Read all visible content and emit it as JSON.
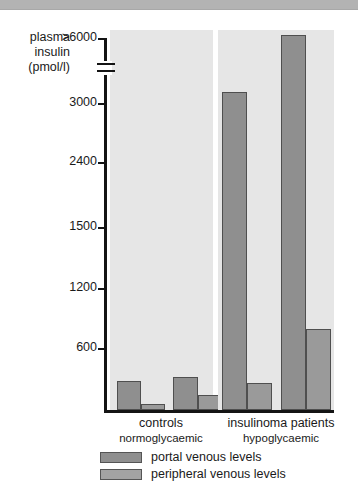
{
  "figure": {
    "axis_title_lines": [
      "plasma",
      "insulin",
      "(pmol/l)"
    ],
    "axis_title_text": "plasma insulin (pmol/l)"
  },
  "chart_data": {
    "type": "bar",
    "title": "",
    "xlabel": "",
    "ylabel": "plasma insulin (pmol/l)",
    "yticks": [
      600,
      1200,
      1500,
      2400,
      3000,
      ">6000"
    ],
    "ytick_labels": [
      "600",
      "1200",
      "1500",
      "2400",
      "3000",
      ">6000"
    ],
    "axis_broken": true,
    "axis_break_between": [
      "3000",
      ">6000"
    ],
    "grid": false,
    "legend_position": "bottom",
    "groups": [
      {
        "label": "controls",
        "sublabel": "normoglycaemic",
        "subjects": [
          {
            "portal": 600,
            "peripheral": 170
          },
          {
            "portal": 640,
            "peripheral": 380
          }
        ]
      },
      {
        "label": "insulinoma patients",
        "sublabel": "hypoglycaemic",
        "subjects": [
          {
            "portal": 3200,
            "peripheral": 560
          },
          {
            "portal": 6000,
            "peripheral": 1000
          }
        ]
      }
    ],
    "series": [
      {
        "name": "portal venous levels",
        "color": "#8f8f8f",
        "values": [
          600,
          640,
          3200,
          6000
        ]
      },
      {
        "name": "peripheral venous levels",
        "color": "#a3a3a3",
        "values": [
          170,
          380,
          560,
          1000
        ]
      }
    ],
    "categories": [
      "controls subject 1",
      "controls subject 2",
      "insulinoma subject 1",
      "insulinoma subject 2"
    ],
    "bars": [
      {
        "group": "controls",
        "series": "portal venous levels",
        "value": 600,
        "left": 7,
        "width": 24,
        "top": 351,
        "panel": "left"
      },
      {
        "group": "controls",
        "series": "peripheral venous levels",
        "value": 170,
        "left": 31,
        "width": 24,
        "top": 374,
        "panel": "left"
      },
      {
        "group": "controls",
        "series": "portal venous levels",
        "value": 640,
        "left": 63,
        "width": 25,
        "top": 347,
        "panel": "left"
      },
      {
        "group": "controls",
        "series": "peripheral venous levels",
        "value": 380,
        "left": 88,
        "width": 24,
        "top": 365,
        "panel": "left"
      },
      {
        "group": "insulinoma patients",
        "series": "portal venous levels",
        "value": 3200,
        "left": 4,
        "width": 25,
        "top": 62,
        "panel": "right"
      },
      {
        "group": "insulinoma patients",
        "series": "peripheral venous levels",
        "value": 560,
        "left": 29,
        "width": 25,
        "top": 353,
        "panel": "right"
      },
      {
        "group": "insulinoma patients",
        "series": "portal venous levels",
        "value": 6000,
        "left": 63,
        "width": 25,
        "top": 5,
        "panel": "right"
      },
      {
        "group": "insulinoma patients",
        "series": "peripheral venous levels",
        "value": 1000,
        "left": 88,
        "width": 25,
        "top": 299,
        "panel": "right"
      }
    ]
  },
  "yaxis_ticks": [
    {
      "label": ">6000",
      "top": 38
    },
    {
      "label": "3000",
      "top": 103
    },
    {
      "label": "2400",
      "top": 162
    },
    {
      "label": "1500",
      "top": 227
    },
    {
      "label": "1200",
      "top": 288
    },
    {
      "label": "600",
      "top": 348
    }
  ],
  "legend": {
    "items": [
      {
        "label": "portal venous levels",
        "key": "portal"
      },
      {
        "label": "peripheral venous levels",
        "key": "peripheral"
      }
    ]
  }
}
